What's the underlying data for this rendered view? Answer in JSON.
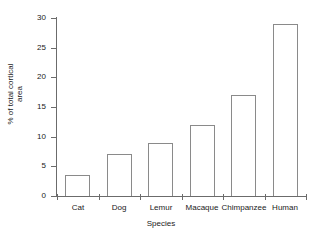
{
  "chart_data": {
    "type": "bar",
    "title": "",
    "xlabel": "Species",
    "ylabel": "% of total cortical area",
    "ylabel_line1": "% of total cortical",
    "ylabel_line2": "area",
    "categories": [
      "Cat",
      "Dog",
      "Lemur",
      "Macaque",
      "Chimpanzee",
      "Human"
    ],
    "values": [
      3.5,
      7,
      9,
      12,
      17,
      29
    ],
    "ylim": [
      0,
      30
    ],
    "ytick_values": [
      0,
      5,
      10,
      15,
      20,
      25,
      30
    ],
    "ytick_labels": [
      "0",
      "5",
      "10",
      "15",
      "20",
      "25",
      "30"
    ],
    "grid": false,
    "legend": null,
    "bar_facecolor": "#ffffff",
    "bar_edgecolor": "#8a8a8a",
    "axis_color": "#6b6b6b",
    "text_color": "#1a1a1a",
    "background": "#ffffff"
  }
}
